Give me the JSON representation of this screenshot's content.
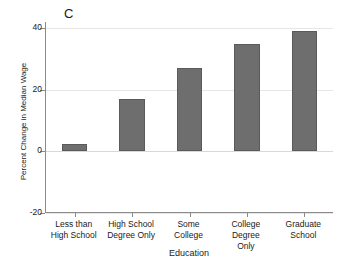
{
  "chart_data": {
    "type": "bar",
    "title": "",
    "panel_label": "C",
    "categories": [
      "Less than\nHigh School",
      "High School\nDegree Only",
      "Some\nCollege",
      "College Degree\nOnly",
      "Graduate\nSchool"
    ],
    "category_lines": [
      [
        "Less than",
        "High School"
      ],
      [
        "High School",
        "Degree Only"
      ],
      [
        "Some",
        "College"
      ],
      [
        "College Degree",
        "Only"
      ],
      [
        "Graduate",
        "School"
      ]
    ],
    "values": [
      2.5,
      17,
      27,
      35,
      39
    ],
    "xlabel": "Education",
    "ylabel": "Percent Change in Median Wage",
    "ylim": [
      -20,
      42
    ],
    "yticks": [
      40,
      20,
      0,
      -20
    ],
    "ytick_labels": [
      "40",
      "20",
      "0",
      "-20"
    ],
    "grid": true,
    "grid_color": "#e6e6e6",
    "legend": "none",
    "bar_color": "#6e6e6e",
    "bar_edge_color": "#5a5a5a",
    "axis_color": "#8a8a8a",
    "text_color": "#1a1a1a"
  }
}
